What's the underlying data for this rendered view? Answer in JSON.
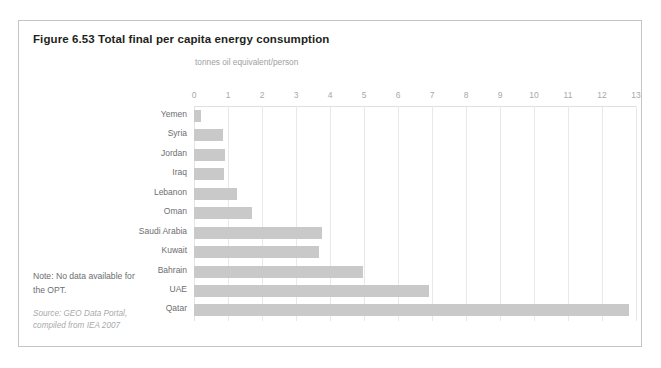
{
  "figure": {
    "title": "Figure 6.53 Total final per capita energy consumption",
    "note_line1": "Note: No data available for",
    "note_line2": "the OPT.",
    "source_line1": "Source: GEO Data Portal,",
    "source_line2": "compiled from IEA 2007"
  },
  "colors": {
    "bar_fill": "#c9c9c9",
    "frame": "#c4c4c4",
    "gridline": "#e8e8e8",
    "title_text": "#231f20",
    "label_text": "#6d6e70",
    "tick_text": "#a8a9ab",
    "source_text": "#a9aaac"
  },
  "chart_data": {
    "type": "bar",
    "orientation": "horizontal",
    "title": "Figure 6.53 Total final per capita energy consumption",
    "subtitle": "",
    "xlabel": "tonnes oil equivalent/person",
    "ylabel": "",
    "xlim": [
      0,
      13
    ],
    "xticks": [
      0,
      1,
      2,
      3,
      4,
      5,
      6,
      7,
      8,
      9,
      10,
      11,
      12,
      13
    ],
    "xtick_labels": [
      "0",
      "1",
      "2",
      "3",
      "4",
      "5",
      "6",
      "7",
      "8",
      "9",
      "10",
      "11",
      "12",
      "13"
    ],
    "grid": true,
    "legend": false,
    "categories": [
      "Yemen",
      "Syria",
      "Jordan",
      "Iraq",
      "Lebanon",
      "Oman",
      "Saudi Arabia",
      "Kuwait",
      "Bahrain",
      "UAE",
      "Qatar"
    ],
    "values": [
      0.2,
      0.85,
      0.9,
      0.88,
      1.26,
      1.7,
      3.75,
      3.68,
      4.97,
      6.9,
      12.8
    ],
    "annotations": [
      "Note: No data available for the OPT.",
      "Source: GEO Data Portal, compiled from IEA 2007"
    ]
  }
}
